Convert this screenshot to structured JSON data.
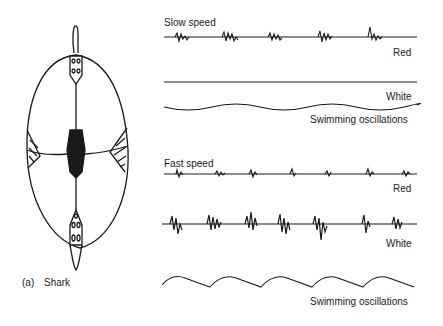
{
  "figure": {
    "panel_label": "(a)",
    "animal": "Shark",
    "slow": {
      "title": "Slow speed",
      "red_label": "Red",
      "white_label": "White",
      "osc_label": "Swimming oscillations"
    },
    "fast": {
      "title": "Fast speed",
      "red_label": "Red",
      "white_label": "White",
      "osc_label": "Swimming oscillations"
    }
  }
}
